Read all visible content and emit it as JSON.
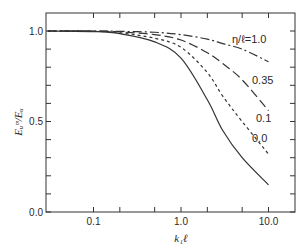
{
  "chart_data": {
    "type": "line",
    "title": "",
    "xlabel": "k₁ℓ",
    "ylabel": "Eᵤᵐ/Eᵤ",
    "xscale": "log",
    "xlim": [
      0.029,
      20
    ],
    "ylim": [
      0.0,
      1.1
    ],
    "grid": false,
    "legend": "inline labels at right end of curves",
    "x_ticks": [
      {
        "value": 0.1,
        "label": "0.1"
      },
      {
        "value": 1.0,
        "label": "1.0"
      },
      {
        "value": 10.0,
        "label": "10.0"
      }
    ],
    "x_minor_ticks": [
      0.2,
      0.5,
      2,
      5
    ],
    "y_ticks": [
      {
        "value": 0.0,
        "label": "0.0"
      },
      {
        "value": 0.5,
        "label": "0.5"
      },
      {
        "value": 1.0,
        "label": "1.0"
      }
    ],
    "y_minor_ticks": [
      0.1,
      0.2,
      0.3,
      0.4,
      0.6,
      0.7,
      0.8,
      0.9
    ],
    "x": [
      0.03,
      0.1,
      0.2,
      0.5,
      1.0,
      2.0,
      3.0,
      5.0,
      10.0
    ],
    "series": [
      {
        "name": "η/ℓ=1.0",
        "label": "η/ℓ=1.0",
        "style": "dash-dot",
        "values": [
          1.0,
          1.0,
          0.998,
          0.993,
          0.98,
          0.955,
          0.93,
          0.9,
          0.83
        ]
      },
      {
        "name": "0.35",
        "label": "0.35",
        "style": "long-dash",
        "values": [
          1.0,
          1.0,
          0.995,
          0.98,
          0.95,
          0.88,
          0.82,
          0.73,
          0.56
        ]
      },
      {
        "name": "0.1",
        "label": "0.1",
        "style": "short-dash",
        "values": [
          1.0,
          0.998,
          0.99,
          0.96,
          0.91,
          0.77,
          0.64,
          0.5,
          0.32
        ]
      },
      {
        "name": "0.0",
        "label": "0.0",
        "style": "solid",
        "values": [
          1.0,
          0.997,
          0.985,
          0.94,
          0.85,
          0.62,
          0.45,
          0.3,
          0.15
        ]
      }
    ]
  }
}
